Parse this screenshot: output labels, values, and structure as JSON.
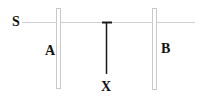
{
  "diagram": {
    "title": "",
    "labels": {
      "source": "S",
      "plate_a": "A",
      "plate_b": "B",
      "rod": "X"
    },
    "colors": {
      "line": "#cfcfcf",
      "plate_outline": "#c8c8c8",
      "rod": "#1a1a1a",
      "text": "#111111",
      "background": "#ffffff"
    }
  }
}
